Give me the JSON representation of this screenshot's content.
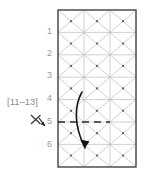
{
  "figure": {
    "title": "",
    "type": "triangular-mesh-diagram",
    "frame": {
      "x": 58,
      "y": 10,
      "width": 78,
      "height": 157,
      "stroke": "#4a4a4a"
    },
    "mesh": {
      "line_color": "#b9b9b9",
      "node_color": "#555555",
      "columns": 3,
      "rows": 7,
      "description": "isometric triangular finite-element mesh"
    },
    "row_labels": [
      {
        "text": "1",
        "row": 1
      },
      {
        "text": "2",
        "row": 2
      },
      {
        "text": "3",
        "row": 3
      },
      {
        "text": "4",
        "row": 4
      },
      {
        "text": "5",
        "row": 5
      },
      {
        "text": "6",
        "row": 6
      }
    ],
    "annotation": {
      "range_label": "[11–13]",
      "marker_symbol": "✕",
      "marker_arrow": "down-right"
    },
    "dashed_line": {
      "at_row": 5,
      "color": "#2b2b2b",
      "dash_pattern": "7 5"
    },
    "curved_arrow": {
      "color": "#1a1a1a",
      "direction": "downward-curved",
      "start_row": 4,
      "end_row": 6
    }
  }
}
